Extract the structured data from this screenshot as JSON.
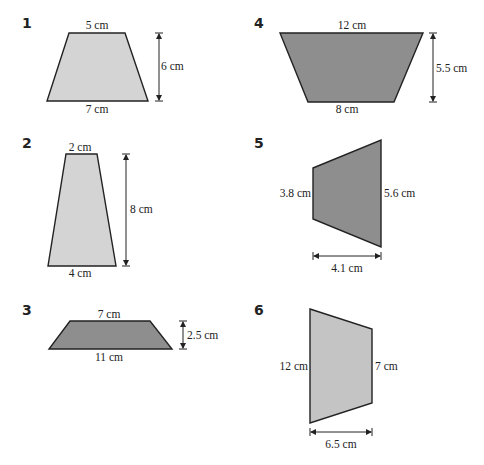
{
  "problems": [
    {
      "number": "1",
      "top": "5 cm",
      "bottom": "7 cm",
      "height": "6 cm",
      "fill": "#d4d4d4"
    },
    {
      "number": "2",
      "top": "2 cm",
      "bottom": "4 cm",
      "height": "8 cm",
      "fill": "#d4d4d4"
    },
    {
      "number": "3",
      "top": "7 cm",
      "bottom": "11 cm",
      "height": "2.5 cm",
      "fill": "#8e8e8e"
    },
    {
      "number": "4",
      "top": "12 cm",
      "bottom": "8 cm",
      "height": "5.5 cm",
      "fill": "#8e8e8e"
    },
    {
      "number": "5",
      "left": "3.8 cm",
      "right": "5.6 cm",
      "width": "4.1 cm",
      "fill": "#8e8e8e"
    },
    {
      "number": "6",
      "left": "12 cm",
      "right": "7 cm",
      "width": "6.5 cm",
      "fill": "#c4c4c4"
    }
  ]
}
